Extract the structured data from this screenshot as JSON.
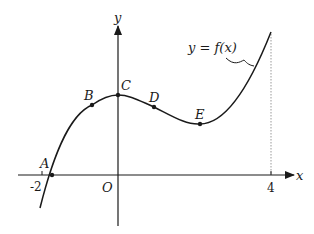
{
  "figure": {
    "type": "function-graph",
    "curve_label": "y = f(x)",
    "axes": {
      "x_label": "x",
      "y_label": "y",
      "origin_label": "O"
    },
    "ticks": {
      "x_neg": "-2",
      "x_pos": "4"
    },
    "points": [
      {
        "name": "A",
        "label": "A"
      },
      {
        "name": "B",
        "label": "B"
      },
      {
        "name": "C",
        "label": "C"
      },
      {
        "name": "D",
        "label": "D"
      },
      {
        "name": "E",
        "label": "E"
      }
    ],
    "colors": {
      "line": "#1a1a1a",
      "guide": "#999999"
    }
  }
}
